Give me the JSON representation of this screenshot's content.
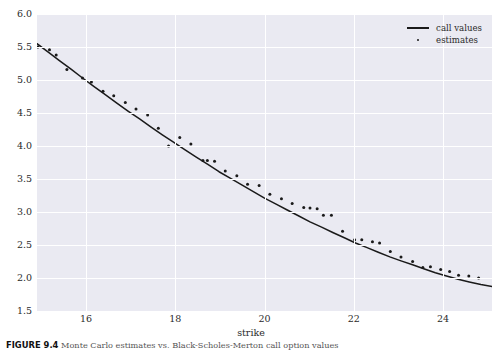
{
  "figure": {
    "caption_label": "FIGURE 9.4",
    "caption_text": "Monte Carlo estimates vs. Black-Scholes-Merton call option values"
  },
  "chart_data": {
    "type": "line",
    "title": "",
    "xlabel": "strike",
    "ylabel": "",
    "xlim": [
      14.9,
      25.1
    ],
    "ylim": [
      1.5,
      6.0
    ],
    "xticks": [
      16,
      18,
      20,
      22,
      24
    ],
    "yticks": [
      1.5,
      2.0,
      2.5,
      3.0,
      3.5,
      4.0,
      4.5,
      5.0,
      5.5,
      6.0
    ],
    "grid": true,
    "legend_position": "upper right",
    "series": [
      {
        "name": "call values",
        "type": "line",
        "color": "#1a1a1a",
        "x": [
          14.9,
          15.16,
          15.41,
          15.67,
          15.92,
          16.18,
          16.43,
          16.69,
          16.94,
          17.2,
          17.45,
          17.71,
          17.96,
          18.22,
          18.47,
          18.73,
          18.98,
          19.24,
          19.49,
          19.75,
          20.0,
          20.26,
          20.51,
          20.77,
          21.02,
          21.28,
          21.53,
          21.79,
          22.04,
          22.3,
          22.55,
          22.81,
          23.06,
          23.32,
          23.57,
          23.83,
          24.08,
          24.34,
          24.59,
          24.85,
          25.1
        ],
        "y": [
          5.55,
          5.42,
          5.29,
          5.16,
          5.03,
          4.9,
          4.78,
          4.65,
          4.53,
          4.41,
          4.29,
          4.17,
          4.06,
          3.94,
          3.83,
          3.72,
          3.61,
          3.51,
          3.41,
          3.31,
          3.21,
          3.12,
          3.03,
          2.94,
          2.85,
          2.77,
          2.69,
          2.61,
          2.53,
          2.46,
          2.39,
          2.32,
          2.26,
          2.2,
          2.14,
          2.08,
          2.03,
          1.98,
          1.94,
          1.9,
          1.87
        ]
      },
      {
        "name": "estimates",
        "type": "scatter",
        "color": "#1a1a1a",
        "x": [
          14.92,
          15.18,
          15.33,
          15.57,
          15.92,
          16.12,
          16.38,
          16.62,
          16.88,
          17.12,
          17.38,
          17.62,
          17.85,
          18.1,
          18.35,
          18.62,
          18.72,
          18.88,
          19.12,
          19.38,
          19.62,
          19.88,
          20.12,
          20.38,
          20.62,
          20.88,
          21.02,
          21.18,
          21.32,
          21.5,
          21.75,
          22.02,
          22.18,
          22.42,
          22.58,
          22.82,
          23.06,
          23.32,
          23.55,
          23.72,
          23.95,
          24.15,
          24.35,
          24.58,
          24.8
        ],
        "y": [
          5.5,
          5.46,
          5.38,
          5.16,
          5.03,
          4.97,
          4.83,
          4.76,
          4.66,
          4.56,
          4.47,
          4.27,
          4.0,
          4.13,
          4.03,
          3.78,
          3.78,
          3.77,
          3.62,
          3.55,
          3.42,
          3.4,
          3.27,
          3.2,
          3.13,
          3.07,
          3.06,
          3.05,
          2.95,
          2.95,
          2.71,
          2.58,
          2.58,
          2.55,
          2.53,
          2.4,
          2.32,
          2.25,
          2.16,
          2.17,
          2.13,
          2.1,
          2.04,
          2.03,
          2.0
        ]
      }
    ]
  },
  "legend": {
    "items": [
      {
        "label": "call values",
        "marker": "line-marker"
      },
      {
        "label": "estimates",
        "marker": "dot-marker"
      }
    ]
  },
  "axis": {
    "x_tick_labels": [
      "16",
      "18",
      "20",
      "22",
      "24"
    ],
    "y_tick_labels": [
      "1.5",
      "2.0",
      "2.5",
      "3.0",
      "3.5",
      "4.0",
      "4.5",
      "5.0",
      "5.5",
      "6.0"
    ],
    "x_title": "strike"
  },
  "style": {
    "plot_background": "#EAEAF2",
    "grid_color": "#FFFFFF",
    "line_color": "#1A1A1A",
    "marker_color": "#1A1A1A",
    "text_color": "#2B2B2B",
    "page_background": "#FFFFFF"
  }
}
